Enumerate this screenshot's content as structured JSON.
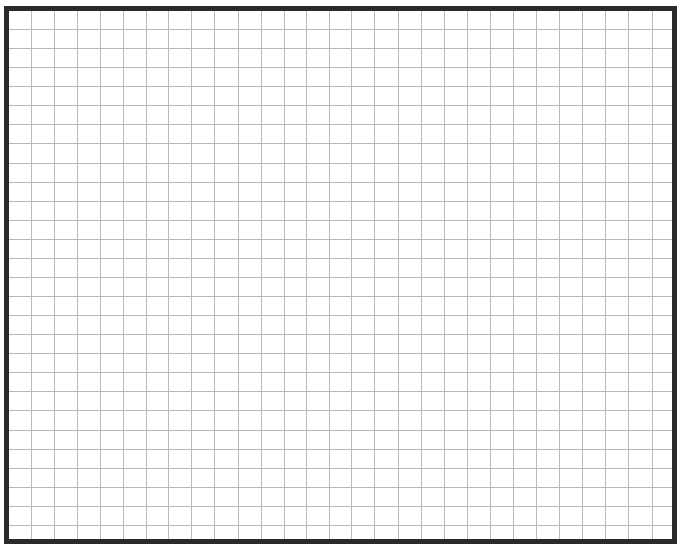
{
  "page": {
    "type": "blank-grid-paper"
  },
  "grid": {
    "frame_color": "#2a2a2a",
    "line_color": "#b9b9b9",
    "background_color": "#ffffff",
    "frame_thickness_px": 5,
    "columns": 29,
    "rows": 28,
    "vertical_lines_x": [
      31,
      54,
      77,
      100,
      123,
      146,
      168,
      191,
      214,
      238,
      261,
      284,
      306,
      329,
      351,
      374,
      398,
      421,
      444,
      467,
      490,
      513,
      536,
      559,
      582,
      605,
      628,
      652
    ],
    "horizontal_lines_y": [
      29,
      48,
      67,
      86,
      105,
      124,
      143,
      163,
      182,
      201,
      220,
      239,
      258,
      277,
      296,
      315,
      334,
      353,
      372,
      391,
      410,
      430,
      449,
      468,
      487,
      506,
      525
    ]
  }
}
